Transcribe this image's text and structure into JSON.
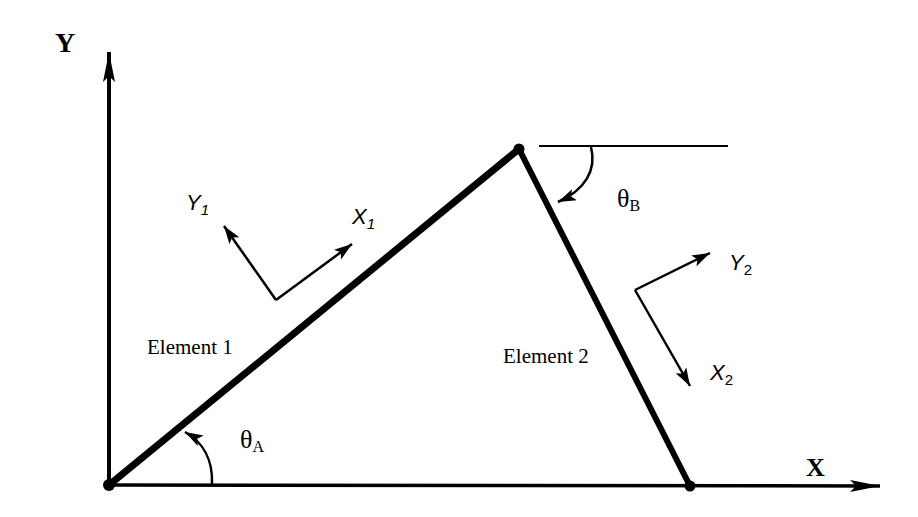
{
  "diagram": {
    "type": "two-element truss frame with local coordinate systems",
    "global_axes": {
      "x_label": "X",
      "y_label": "Y"
    },
    "elements": [
      {
        "label": "Element 1",
        "local_x_label": "X",
        "local_x_sub": "1",
        "local_y_label": "Y",
        "local_y_sub": "1",
        "angle_label": "θ",
        "angle_sub": "A"
      },
      {
        "label": "Element 2",
        "local_x_label": "X",
        "local_x_sub": "2",
        "local_y_label": "Y",
        "local_y_sub": "2",
        "angle_label": "θ",
        "angle_sub": "B"
      }
    ],
    "nodes": [
      "origin-node",
      "apex-node",
      "right-base-node"
    ],
    "colors": {
      "line": "#000000",
      "background": "#ffffff"
    }
  }
}
